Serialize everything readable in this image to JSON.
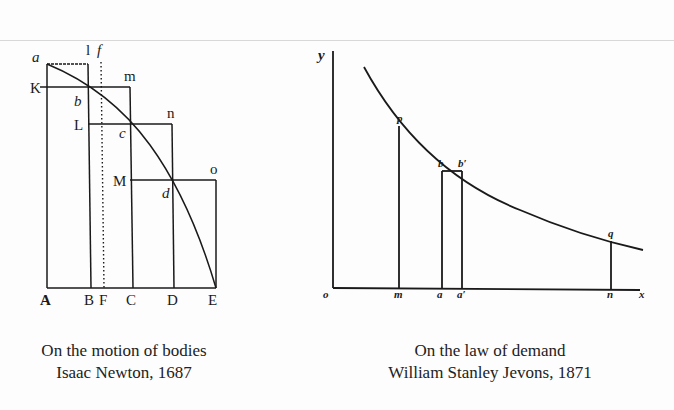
{
  "figures": [
    {
      "caption_title": "On the motion of bodies",
      "caption_author": "Isaac Newton, 1687",
      "labels": {
        "a": "a",
        "l": "l",
        "f": "f",
        "K": "K",
        "m": "m",
        "b": "b",
        "L": "L",
        "n": "n",
        "c": "c",
        "M": "M",
        "o": "o",
        "d": "d",
        "A": "A",
        "B": "B",
        "F": "F",
        "C": "C",
        "D": "D",
        "E": "E"
      }
    },
    {
      "caption_title": "On the law of demand",
      "caption_author": "William Stanley Jevons, 1871",
      "labels": {
        "y": "y",
        "p": "p",
        "b": "b",
        "b_prime": "b′",
        "q": "q",
        "o": "o",
        "m": "m",
        "a": "a",
        "a_prime": "a′",
        "n": "n",
        "x": "x"
      }
    }
  ],
  "colors": {
    "ink": "#1a1a1a",
    "paper": "#fdfdfd"
  }
}
